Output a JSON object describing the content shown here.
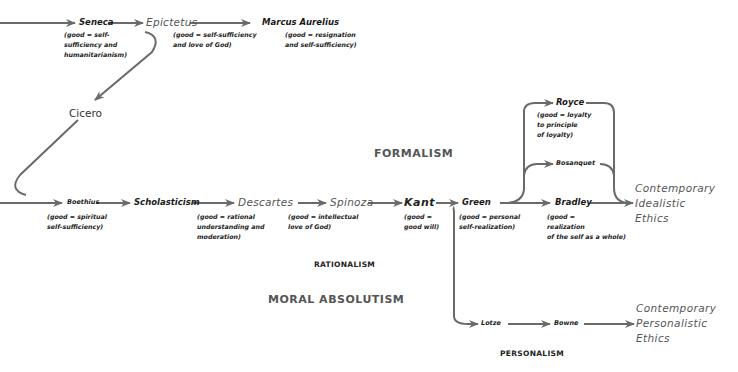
{
  "diagram": {
    "schools": {
      "formalism": "FORMALISM",
      "moral_absolutism": "MORAL ABSOLUTISM",
      "rationalism": "RATIONALISM",
      "personalism": "PERSONALISM"
    },
    "nodes": {
      "seneca": {
        "name": "Seneca",
        "note": "(good = self-\nsufficiency and\nhumanitarianism)"
      },
      "epictetus": {
        "name": "Epictetus",
        "note": "(good = self-sufficiency\nand love of God)"
      },
      "marcus_aurelius": {
        "name": "Marcus Aurelius",
        "note": "(good = resignation\nand self-sufficiency)"
      },
      "cicero": {
        "name": "Cicero"
      },
      "boethius": {
        "name": "Boethius",
        "note": "(good = spiritual\nself-sufficiency)"
      },
      "scholasticism": {
        "name": "Scholasticism"
      },
      "descartes": {
        "name": "Descartes",
        "note": "(good = rational\nunderstanding and\nmoderation)"
      },
      "spinoza": {
        "name": "Spinoza",
        "note": "(good = intellectual\nlove of God)"
      },
      "kant": {
        "name": "Kant",
        "note": "(good =\ngood will)"
      },
      "green": {
        "name": "Green",
        "note": "(good = personal\nself-realization)"
      },
      "bradley": {
        "name": "Bradley",
        "note": "(good =\nrealization\nof the self as a whole)"
      },
      "royce": {
        "name": "Royce",
        "note": "(good = loyalty\nto principle\nof loyalty)"
      },
      "bosanquet": {
        "name": "Bosanquet"
      },
      "lotze": {
        "name": "Lotze"
      },
      "bowne": {
        "name": "Bowne"
      }
    },
    "outcomes": {
      "idealistic": "Contemporary\nIdealistic\nEthics",
      "personalistic": "Contemporary\nPersonalistic\nEthics"
    },
    "edges": [
      [
        "start",
        "seneca"
      ],
      [
        "seneca",
        "epictetus"
      ],
      [
        "epictetus",
        "marcus_aurelius"
      ],
      [
        "epictetus",
        "cicero"
      ],
      [
        "cicero",
        "boethius"
      ],
      [
        "start2",
        "boethius"
      ],
      [
        "boethius",
        "scholasticism"
      ],
      [
        "scholasticism",
        "descartes"
      ],
      [
        "descartes",
        "spinoza"
      ],
      [
        "spinoza",
        "kant"
      ],
      [
        "kant",
        "green"
      ],
      [
        "kant",
        "lotze"
      ],
      [
        "green",
        "bradley"
      ],
      [
        "green",
        "royce"
      ],
      [
        "green",
        "bosanquet"
      ],
      [
        "royce",
        "idealistic"
      ],
      [
        "bosanquet",
        "idealistic"
      ],
      [
        "bradley",
        "idealistic"
      ],
      [
        "lotze",
        "bowne"
      ],
      [
        "bowne",
        "personalistic"
      ]
    ],
    "colors": {
      "line": "#6a6a6a",
      "text": "#1a1a1a",
      "muted": "#555555"
    }
  }
}
